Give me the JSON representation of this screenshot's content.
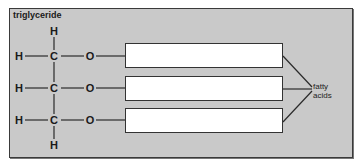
{
  "title": "triglyceride",
  "atoms": {
    "h_top": "H",
    "h_bottom": "H",
    "row1": {
      "h": "H",
      "c": "C",
      "o": "O"
    },
    "row2": {
      "h": "H",
      "c": "C",
      "o": "O"
    },
    "row3": {
      "h": "H",
      "c": "C",
      "o": "O"
    }
  },
  "fatty_acid_boxes": [
    "",
    "",
    ""
  ],
  "label": {
    "line1": "fatty",
    "line2": "acids"
  },
  "colors": {
    "panel": "#c9c9c9",
    "border": "#3a3a3a",
    "box": "#ffffff"
  }
}
